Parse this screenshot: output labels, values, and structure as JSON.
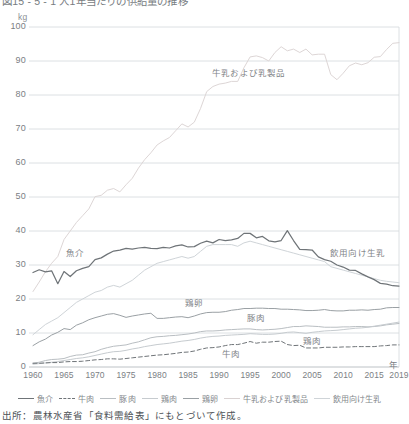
{
  "title": "図15 - 5 - 1 人1年当たりの供給量の推移",
  "unit": "kg",
  "axis": {
    "x_name": "年",
    "y_ticks": [
      "100",
      "90",
      "80",
      "70",
      "60",
      "50",
      "40",
      "30",
      "20",
      "10",
      "0"
    ],
    "x_ticks": [
      "1960",
      "1965",
      "1970",
      "1975",
      "1980",
      "1985",
      "1990",
      "1995",
      "2000",
      "2005",
      "2010",
      "2015",
      "2019"
    ]
  },
  "annotations": [
    {
      "name": "milk-and-dairy",
      "text": "牛乳および乳製品",
      "x": 212,
      "y": 66
    },
    {
      "name": "seafood",
      "text": "魚介",
      "x": 66,
      "y": 246
    },
    {
      "name": "drinking-milk",
      "text": "飲用向け生乳",
      "x": 330,
      "y": 246
    },
    {
      "name": "eggs",
      "text": "鶏卵",
      "x": 185,
      "y": 296
    },
    {
      "name": "pork",
      "text": "豚肉",
      "x": 247,
      "y": 311
    },
    {
      "name": "chicken",
      "text": "鶏肉",
      "x": 303,
      "y": 334
    },
    {
      "name": "beef",
      "text": "牛肉",
      "x": 222,
      "y": 347
    }
  ],
  "legend": [
    {
      "label": "魚介",
      "color": "#6f7478",
      "style": "solid"
    },
    {
      "label": "牛肉",
      "color": "#6f7478",
      "style": "dashed"
    },
    {
      "label": "豚肉",
      "color": "#b9bec2",
      "style": "solid"
    },
    {
      "label": "鶏肉",
      "color": "#c6cbcf",
      "style": "solid"
    },
    {
      "label": "鶏卵",
      "color": "#9aa0a4",
      "style": "solid"
    },
    {
      "label": "牛乳および乳製品",
      "color": "#d9d2d2",
      "style": "solid"
    },
    {
      "label": "飲用向け生乳",
      "color": "#cfd4d8",
      "style": "solid"
    }
  ],
  "source": "出所：農林水産省「食料需給表」にもとづいて作成。",
  "chart_data": {
    "type": "line",
    "title": "図15 - 5 - 1 人1年当たりの供給量の推移",
    "xlabel": "年",
    "ylabel": "kg",
    "xlim": [
      1960,
      2019
    ],
    "ylim": [
      0,
      100
    ],
    "grid": "horizontal",
    "legend_position": "bottom",
    "x": [
      1960,
      1961,
      1962,
      1963,
      1964,
      1965,
      1966,
      1967,
      1968,
      1969,
      1970,
      1971,
      1972,
      1973,
      1974,
      1975,
      1976,
      1977,
      1978,
      1979,
      1980,
      1981,
      1982,
      1983,
      1984,
      1985,
      1986,
      1987,
      1988,
      1989,
      1990,
      1991,
      1992,
      1993,
      1994,
      1995,
      1996,
      1997,
      1998,
      1999,
      2000,
      2001,
      2002,
      2003,
      2004,
      2005,
      2006,
      2007,
      2008,
      2009,
      2010,
      2011,
      2012,
      2013,
      2014,
      2015,
      2016,
      2017,
      2018,
      2019
    ],
    "series": [
      {
        "name": "魚介",
        "color": "#6f7478",
        "style": "solid",
        "values": [
          27.8,
          28.6,
          28.0,
          28.3,
          24.5,
          28.1,
          26.6,
          28.3,
          29.0,
          29.5,
          31.6,
          32.1,
          33.2,
          34.1,
          34.4,
          34.9,
          34.7,
          35.0,
          35.2,
          34.9,
          34.8,
          35.2,
          35.0,
          35.6,
          35.9,
          35.3,
          35.4,
          36.4,
          37.0,
          36.5,
          37.5,
          37.2,
          37.4,
          37.8,
          39.3,
          39.3,
          38.0,
          38.4,
          37.1,
          36.8,
          37.2,
          40.1,
          37.2,
          34.6,
          34.5,
          34.4,
          32.4,
          31.6,
          31.1,
          30.0,
          29.4,
          28.5,
          28.4,
          27.4,
          26.5,
          25.7,
          24.6,
          24.4,
          23.9,
          23.8
        ]
      },
      {
        "name": "牛肉",
        "color": "#6f7478",
        "style": "dashed",
        "values": [
          1.1,
          1.1,
          1.2,
          1.3,
          1.3,
          1.5,
          1.6,
          1.6,
          1.7,
          1.9,
          2.1,
          2.2,
          2.4,
          2.4,
          2.3,
          2.5,
          2.7,
          2.9,
          3.1,
          3.3,
          3.5,
          3.6,
          3.8,
          4.0,
          4.3,
          4.4,
          4.7,
          5.2,
          5.6,
          5.7,
          5.9,
          6.3,
          6.6,
          6.6,
          7.0,
          7.5,
          7.0,
          7.3,
          7.3,
          7.5,
          7.6,
          6.6,
          6.3,
          6.4,
          5.6,
          5.6,
          5.6,
          5.8,
          5.8,
          5.8,
          5.9,
          5.9,
          6.0,
          6.0,
          6.0,
          6.0,
          6.2,
          6.3,
          6.5,
          6.5
        ]
      },
      {
        "name": "豚肉",
        "color": "#b9bec2",
        "style": "solid",
        "values": [
          1.1,
          1.4,
          1.9,
          2.2,
          2.3,
          2.5,
          3.1,
          3.5,
          3.6,
          4.1,
          4.5,
          5.2,
          5.7,
          6.1,
          6.3,
          6.5,
          7.0,
          7.4,
          8.0,
          8.6,
          8.9,
          9.0,
          9.2,
          9.3,
          9.5,
          9.7,
          10.0,
          10.4,
          10.6,
          10.6,
          10.7,
          10.9,
          11.0,
          11.1,
          11.2,
          11.2,
          11.0,
          10.9,
          11.0,
          11.1,
          11.3,
          11.6,
          11.9,
          11.9,
          12.1,
          12.0,
          11.9,
          11.7,
          11.7,
          11.7,
          11.8,
          11.8,
          11.9,
          11.9,
          11.8,
          11.9,
          12.1,
          12.4,
          12.6,
          12.8
        ]
      },
      {
        "name": "鶏肉",
        "color": "#c6cbcf",
        "style": "solid",
        "values": [
          0.8,
          1.0,
          1.2,
          1.4,
          1.6,
          1.9,
          2.2,
          2.5,
          2.7,
          3.0,
          3.4,
          3.8,
          4.2,
          4.5,
          4.6,
          4.9,
          5.3,
          5.6,
          6.0,
          6.3,
          6.6,
          6.8,
          7.0,
          7.3,
          7.6,
          7.8,
          8.1,
          8.5,
          8.8,
          9.0,
          9.1,
          9.3,
          9.4,
          9.5,
          9.6,
          9.8,
          9.7,
          9.6,
          9.6,
          9.7,
          9.9,
          10.2,
          10.3,
          10.1,
          9.9,
          10.2,
          10.4,
          10.6,
          10.7,
          10.8,
          11.0,
          11.2,
          11.4,
          11.5,
          11.7,
          12.0,
          12.3,
          12.6,
          12.9,
          13.2
        ]
      },
      {
        "name": "鶏卵",
        "color": "#9aa0a4",
        "style": "solid",
        "values": [
          6.3,
          7.4,
          8.2,
          9.4,
          10.2,
          11.3,
          11.0,
          12.3,
          13.0,
          13.9,
          14.5,
          15.0,
          15.5,
          15.7,
          15.2,
          14.6,
          15.0,
          15.3,
          15.6,
          15.8,
          14.3,
          14.3,
          14.5,
          14.7,
          14.8,
          14.5,
          15.0,
          15.6,
          16.0,
          16.1,
          16.1,
          16.3,
          16.7,
          16.9,
          17.2,
          17.2,
          17.3,
          17.3,
          17.2,
          17.2,
          17.0,
          17.0,
          16.9,
          16.8,
          16.6,
          16.6,
          16.7,
          16.9,
          16.6,
          16.5,
          16.5,
          16.7,
          16.7,
          16.8,
          16.7,
          16.9,
          17.0,
          17.4,
          17.5,
          17.5
        ]
      },
      {
        "name": "牛乳および乳製品",
        "color": "#ddd6d6",
        "style": "solid",
        "values": [
          22.2,
          25.0,
          28.0,
          30.5,
          32.5,
          37.5,
          40.0,
          42.5,
          44.5,
          46.5,
          50.1,
          50.5,
          52.0,
          52.5,
          51.5,
          53.6,
          55.5,
          58.5,
          61.0,
          63.0,
          65.3,
          66.5,
          67.5,
          69.5,
          71.5,
          70.6,
          72.0,
          76.0,
          81.0,
          82.5,
          83.2,
          83.5,
          84.0,
          84.0,
          88.0,
          91.2,
          91.5,
          91.0,
          90.0,
          92.5,
          94.2,
          93.0,
          93.5,
          92.5,
          93.5,
          91.8,
          92.0,
          92.0,
          86.0,
          84.5,
          86.4,
          88.6,
          89.4,
          88.9,
          89.5,
          91.1,
          91.3,
          93.4,
          95.2,
          95.4
        ]
      },
      {
        "name": "飲用向け生乳",
        "color": "#cfd4d8",
        "style": "solid",
        "values": [
          9.5,
          11.0,
          12.5,
          13.5,
          14.5,
          16.0,
          17.5,
          19.0,
          20.0,
          21.0,
          22.0,
          22.5,
          23.5,
          24.0,
          23.5,
          24.5,
          25.5,
          27.0,
          28.5,
          29.5,
          30.5,
          31.0,
          31.5,
          32.0,
          32.5,
          32.0,
          32.5,
          34.0,
          35.5,
          36.0,
          36.0,
          36.0,
          36.0,
          35.5,
          36.5,
          37.0,
          36.5,
          36.0,
          35.5,
          35.0,
          34.5,
          34.0,
          33.5,
          33.0,
          32.5,
          32.0,
          31.5,
          31.0,
          29.5,
          29.0,
          28.5,
          28.0,
          27.5,
          27.0,
          26.5,
          26.0,
          25.5,
          25.2,
          25.0,
          24.8
        ]
      }
    ]
  }
}
